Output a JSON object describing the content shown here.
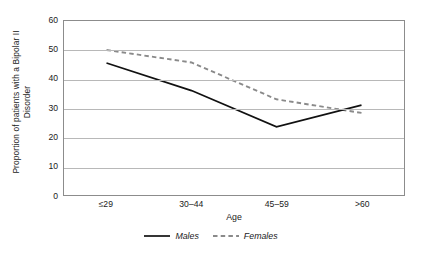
{
  "chart_data": {
    "type": "line",
    "title": "",
    "xlabel": "Age",
    "ylabel": "Proportion of patients with a Bipolar II Disorder",
    "ylabel_line1": "Proportion of patients with a Bipolar II",
    "ylabel_line2": "Disorder",
    "categories": [
      "≤29",
      "30–44",
      "45–59",
      ">60"
    ],
    "ylim": [
      0,
      60
    ],
    "ytick_labels": [
      "0",
      "10",
      "20",
      "30",
      "40",
      "50",
      "60"
    ],
    "ytick_values": [
      0,
      10,
      20,
      30,
      40,
      50,
      60
    ],
    "grid": "horizontal",
    "legend_position": "bottom-center",
    "series": [
      {
        "name": "Males",
        "style": "solid",
        "color": "#111111",
        "values": [
          45.5,
          36.0,
          23.5,
          31.0
        ]
      },
      {
        "name": "Females",
        "style": "dashed",
        "color": "#8a8a8a",
        "values": [
          50.0,
          45.7,
          33.0,
          28.3
        ]
      }
    ]
  },
  "legend": {
    "males_label": "Males",
    "females_label": "Females"
  },
  "colors": {
    "males_line": "#111111",
    "females_line": "#8a8a8a",
    "gridline": "#b8b8b8",
    "frame": "#8c8c8c",
    "background": "#ffffff",
    "text": "#1a1a1a"
  }
}
